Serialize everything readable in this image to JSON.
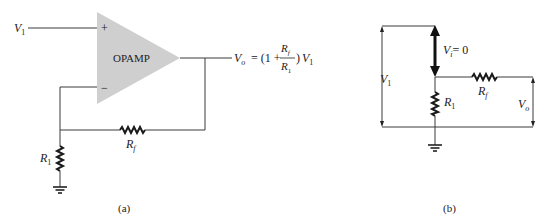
{
  "panel_a": {
    "caption": "(a)",
    "opamp_label": "OPAMP",
    "plus_sign": "+",
    "minus_sign": "−",
    "input_label": "V",
    "input_sub": "1",
    "output_eq": {
      "lhs": "V",
      "lhs_sub": "o",
      "eq_open": "= (1 +",
      "num": "R",
      "num_sub": "f",
      "den": "R",
      "den_sub": "1",
      "close": ")",
      "tail": "V",
      "tail_sub": "1"
    },
    "r1_label": "R",
    "r1_sub": "1",
    "rf_label": "R",
    "rf_sub": "f",
    "colors": {
      "opamp_fill": "#cfcfcf",
      "wire": "#3a3a3a"
    }
  },
  "panel_b": {
    "caption": "(b)",
    "vi_label": "V",
    "vi_sub": "i",
    "vi_value": "= 0",
    "v1_label": "V",
    "v1_sub": "1",
    "r1_label": "R",
    "r1_sub": "1",
    "rf_label": "R",
    "rf_sub": "f",
    "vo_label": "V",
    "vo_sub": "o"
  }
}
